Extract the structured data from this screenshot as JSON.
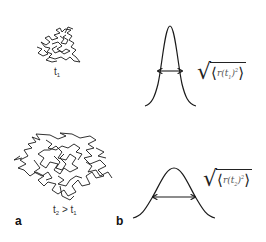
{
  "figure": {
    "panel_a": {
      "letter": "a",
      "walk_small_label": {
        "t": "t",
        "sub": "1"
      },
      "walk_large_label": {
        "t1": "t",
        "sub1": "2",
        "op": " > ",
        "t2": "t",
        "sub2": "1"
      }
    },
    "panel_b": {
      "letter": "b",
      "narrow_curve_formula": {
        "root": "√",
        "open": "⟨",
        "r": "r",
        "paren_open": "(",
        "t": "t",
        "sub": "1",
        "paren_close": ")",
        "sup": "2",
        "close": "⟩"
      },
      "wide_curve_formula": {
        "root": "√",
        "open": "⟨",
        "r": "r",
        "paren_open": "(",
        "t": "t",
        "sub": "2",
        "paren_close": ")",
        "sup": "2",
        "close": "⟩"
      }
    },
    "colors": {
      "line": "#1a1a1a",
      "background": "#ffffff"
    }
  }
}
